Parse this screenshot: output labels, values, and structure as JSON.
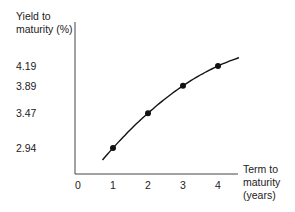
{
  "chart_data": {
    "type": "line",
    "title": "",
    "ylabel_lines": [
      "Yield to",
      "maturity (%)"
    ],
    "xlabel_lines": [
      "Term to",
      "maturity",
      "(years)"
    ],
    "x_ticks": [
      "0",
      "1",
      "2",
      "3",
      "4"
    ],
    "y_ticks": [
      "2.94",
      "3.47",
      "3.89",
      "4.19"
    ],
    "series": [
      {
        "name": "Yield curve",
        "x": [
          1,
          2,
          3,
          4
        ],
        "values": [
          2.94,
          3.47,
          3.89,
          4.19
        ]
      }
    ],
    "curve_extends": {
      "x_start": 0.7,
      "x_end": 4.6
    },
    "grid": false,
    "legend": "none",
    "color": "#111111"
  }
}
